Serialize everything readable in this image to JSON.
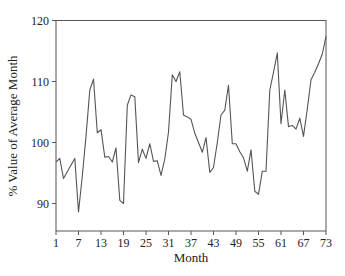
{
  "chart_data": {
    "type": "line",
    "title": "",
    "xlabel": "Month",
    "ylabel": "% Value of Average Month",
    "xlim": [
      1,
      73
    ],
    "ylim": [
      85.5,
      120
    ],
    "xticks": [
      1,
      7,
      13,
      19,
      25,
      31,
      37,
      43,
      49,
      55,
      61,
      67,
      73
    ],
    "yticks": [
      90,
      100,
      110,
      120
    ],
    "grid": false,
    "legend": null,
    "x": [
      1,
      2,
      3,
      4,
      5,
      6,
      7,
      8,
      9,
      10,
      11,
      12,
      13,
      14,
      15,
      16,
      17,
      18,
      19,
      20,
      21,
      22,
      23,
      24,
      25,
      26,
      27,
      28,
      29,
      30,
      31,
      32,
      33,
      34,
      35,
      36,
      37,
      38,
      39,
      40,
      41,
      42,
      43,
      44,
      45,
      46,
      47,
      48,
      49,
      50,
      51,
      52,
      53,
      54,
      55,
      56,
      57,
      58,
      59,
      60,
      61,
      62,
      63,
      64,
      65,
      66,
      67,
      68,
      69,
      70,
      71,
      72,
      73
    ],
    "series": [
      {
        "name": "% Value of Average Month",
        "color": "#555555",
        "values": [
          96.8,
          97.4,
          94.1,
          95.2,
          96.3,
          97.4,
          88.6,
          94.5,
          101.0,
          108.6,
          110.4,
          101.6,
          102.1,
          97.6,
          97.7,
          96.8,
          99.1,
          90.5,
          90.0,
          106.1,
          107.8,
          107.5,
          96.7,
          98.9,
          97.4,
          99.8,
          96.9,
          97.0,
          94.6,
          97.3,
          101.7,
          111.1,
          110.0,
          111.6,
          104.5,
          104.2,
          103.8,
          101.5,
          100.0,
          98.4,
          100.8,
          95.1,
          95.9,
          100.0,
          104.5,
          105.3,
          109.4,
          99.8,
          99.8,
          98.5,
          97.5,
          95.3,
          98.8,
          92.0,
          91.5,
          95.3,
          95.3,
          108.6,
          111.5,
          114.7,
          103.1,
          108.6,
          102.6,
          102.8,
          102.2,
          104.0,
          101.0,
          105.5,
          110.3,
          111.5,
          112.9,
          114.5,
          117.4
        ]
      }
    ]
  }
}
